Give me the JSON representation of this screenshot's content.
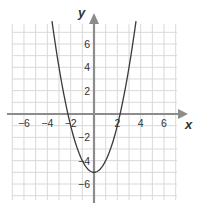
{
  "chart_data": {
    "type": "line",
    "title": "",
    "xlabel": "x",
    "ylabel": "y",
    "equation": "y = x^2 - 5",
    "xlim": [
      -7,
      7
    ],
    "ylim": [
      -7,
      7
    ],
    "grid": true,
    "legend": null,
    "x_ticks": [
      -6,
      -4,
      -2,
      2,
      4,
      6
    ],
    "y_ticks": [
      -6,
      -4,
      -2,
      2,
      4,
      6
    ],
    "x_tick_labels": [
      "−6",
      "−4",
      "−2",
      "2",
      "4",
      "6"
    ],
    "y_tick_labels": [
      "−6",
      "−4",
      "−2",
      "2",
      "4",
      "6"
    ],
    "series": [
      {
        "name": "parabola",
        "x": [
          -3.6,
          -3,
          -2.5,
          -2,
          -1.5,
          -1,
          -0.5,
          0,
          0.5,
          1,
          1.5,
          2,
          2.5,
          3,
          3.6
        ],
        "y": [
          7.96,
          4,
          1.25,
          -1,
          -2.75,
          -4,
          -4.75,
          -5,
          -4.75,
          -4,
          -2.75,
          -1,
          1.25,
          4,
          7.96
        ]
      }
    ],
    "key_points": {
      "vertex": [
        0,
        -5
      ],
      "x_intercepts": [
        -2.236,
        2.236
      ],
      "y_intercept": -5
    }
  },
  "colors": {
    "grid": "#d9d9d9",
    "axis": "#8c8c8c",
    "curve": "#3a3a3a",
    "text": "#333333"
  }
}
